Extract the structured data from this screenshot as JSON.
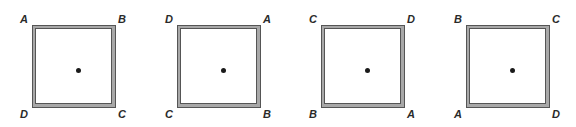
{
  "figures": [
    {
      "corners": {
        "top_left": "A",
        "top_right": "B",
        "bottom_left": "D",
        "bottom_right": "C"
      }
    },
    {
      "corners": {
        "top_left": "D",
        "top_right": "A",
        "bottom_left": "C",
        "bottom_right": "B"
      }
    },
    {
      "corners": {
        "top_left": "C",
        "top_right": "D",
        "bottom_left": "B",
        "bottom_right": "A"
      }
    },
    {
      "corners": {
        "top_left": "B",
        "top_right": "C",
        "bottom_left": "A",
        "bottom_right": "D"
      }
    }
  ],
  "colors": {
    "frame_fill": "#a8a8a8",
    "frame_line": "#555555",
    "label": "#2a2a2a",
    "center_dot": "#1a1a1a"
  }
}
